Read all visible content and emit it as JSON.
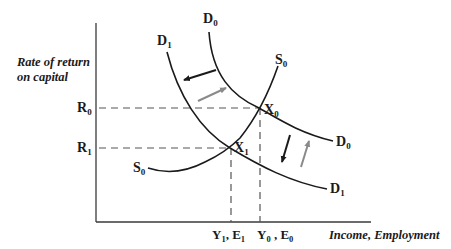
{
  "diagram": {
    "type": "supply-demand economics diagram",
    "y_axis_label_line1": "Rate of return",
    "y_axis_label_line2": "on capital",
    "x_axis_label": "Income,  Employment",
    "y_ticks": [
      {
        "label": "R",
        "sub": "0",
        "y": 108
      },
      {
        "label": "R",
        "sub": "1",
        "y": 148
      }
    ],
    "x_ticks": [
      {
        "label": "Y",
        "sub": "1",
        "label2": ", E",
        "sub2": "1",
        "x": 232
      },
      {
        "label": "Y",
        "sub": "0",
        "label2": " , E",
        "sub2": "0",
        "x": 261
      }
    ],
    "curves": [
      {
        "name": "D",
        "sub": "0",
        "role": "initial demand curve"
      },
      {
        "name": "D",
        "sub": "1",
        "role": "shifted demand curve"
      },
      {
        "name": "S",
        "sub": "0",
        "role": "supply curve"
      }
    ],
    "points": [
      {
        "name": "X",
        "sub": "0",
        "x": 259,
        "y": 108
      },
      {
        "name": "X",
        "sub": "1",
        "x": 230,
        "y": 148
      }
    ],
    "colors": {
      "axis": "#3a3a3a",
      "curve": "#1a1a1a",
      "dashed": "#555555",
      "arrow_dark": "#1a1a1a",
      "arrow_gray": "#8a8a8a"
    }
  }
}
